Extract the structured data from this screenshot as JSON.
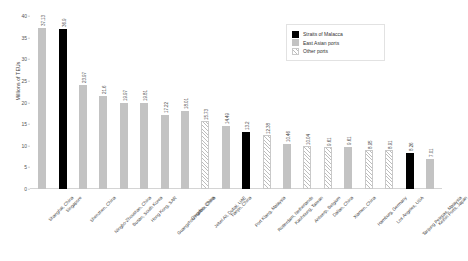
{
  "chart_data": {
    "type": "bar",
    "title": "",
    "xlabel": "",
    "ylabel": "Millions of TEUs",
    "ylim": [
      0,
      40
    ],
    "yticks": [
      40,
      35,
      30,
      25,
      20,
      15,
      10,
      5,
      0
    ],
    "grid": false,
    "legend_position": "top-right",
    "legend": [
      {
        "label": "Straits of Malacca",
        "style": "solid-black",
        "color": "#000000"
      },
      {
        "label": "East Asian ports",
        "style": "solid-gray",
        "color": "#c3c3c3"
      },
      {
        "label": "Other ports",
        "style": "hatched",
        "color": "#bdbdbd"
      }
    ],
    "categories": [
      "Shanghai, China",
      "Singapore",
      "Shenzhen, China",
      "Ningbo-Zhoushan, China",
      "Busan, South Korea",
      "Hong Kong, SAR",
      "Guangzhou Harbor, China",
      "Qingdao, China",
      "Jebel Ali, Dubai, UAE",
      "Tianjin, China",
      "Port Klang, Malaysia",
      "Rotterdam, Netherlands",
      "Kaohsiung, Taiwan",
      "Antwerp, Belgium",
      "Dalian, China",
      "Xiamen, China",
      "Hamburg, Germany",
      "Los Angeles, USA",
      "Tanjung Pelepas, Malaysia",
      "Keihin Ports, Japan"
    ],
    "values": [
      37.13,
      36.9,
      23.97,
      21.6,
      19.97,
      19.81,
      17.22,
      18.01,
      15.73,
      14.49,
      13.2,
      12.38,
      10.46,
      10.04,
      9.61,
      9.61,
      8.95,
      8.91,
      8.26,
      7.01
    ],
    "value_labels": [
      "37.13",
      "36.9",
      "23.97",
      "21.6",
      "19.97",
      "19.81",
      "17.22",
      "18.01",
      "15.73",
      "14.49",
      "13.2",
      "12.38",
      "10.46",
      "10.04",
      "9.61",
      "9.61",
      "8.95",
      "8.91",
      "8.26",
      "7.01"
    ],
    "series_assignment": [
      "east-asian",
      "malacca",
      "east-asian",
      "east-asian",
      "east-asian",
      "east-asian",
      "east-asian",
      "east-asian",
      "other",
      "east-asian",
      "malacca",
      "other",
      "east-asian",
      "other",
      "other",
      "east-asian",
      "other",
      "other",
      "malacca",
      "east-asian"
    ]
  }
}
